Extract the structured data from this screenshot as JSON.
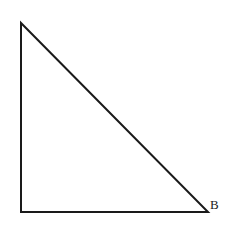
{
  "figure": {
    "background_color": "#ffffff",
    "stroke_color": "#1a1a1a",
    "stroke_width": 2,
    "canvas": {
      "width": 231,
      "height": 228
    },
    "labels": [
      {
        "name": "vertex-b",
        "text": "B",
        "x": 210,
        "y": 198
      }
    ],
    "vertices": {
      "apex": {
        "x": 21,
        "y": 23
      },
      "bottom_left": {
        "x": 21,
        "y": 212
      },
      "bottom_right": {
        "x": 208,
        "y": 212
      }
    },
    "shape": {
      "type": "triangle",
      "right_angle_at": "bottom_left",
      "points": "21,23 21,212 208,212"
    }
  }
}
